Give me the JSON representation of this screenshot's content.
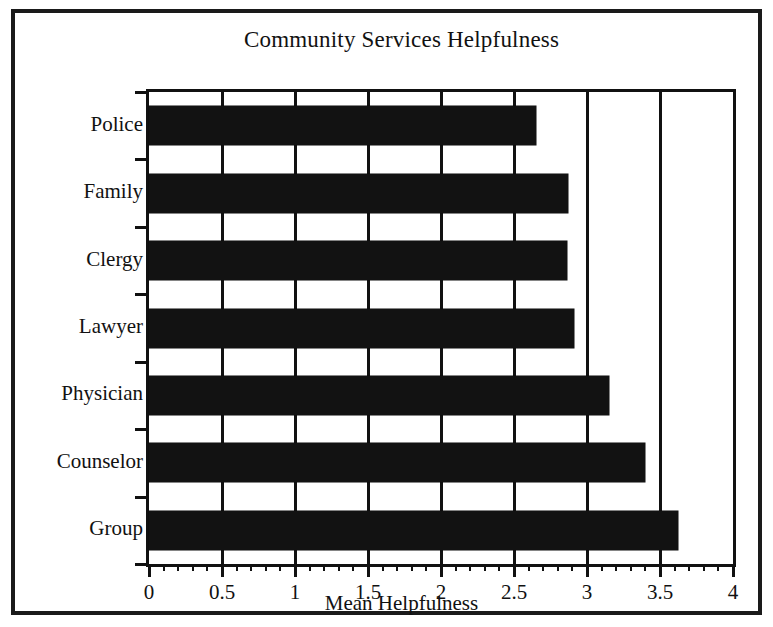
{
  "chart_data": {
    "type": "bar",
    "orientation": "horizontal",
    "title": "Community Services Helpfulness",
    "xlabel": "Mean Helpfulness",
    "ylabel": "",
    "categories": [
      "Police",
      "Family",
      "Clergy",
      "Lawyer",
      "Physician",
      "Counselor",
      "Group"
    ],
    "values": [
      2.65,
      2.87,
      2.86,
      2.91,
      3.15,
      3.4,
      3.62
    ],
    "xlim": [
      0,
      4
    ],
    "xticks": [
      0,
      0.5,
      1,
      1.5,
      2,
      2.5,
      3,
      3.5,
      4
    ],
    "xticklabels": [
      "0",
      "0.5",
      "1",
      "1.5",
      "2",
      "2.5",
      "3",
      "3.5",
      "4"
    ],
    "minor_tick_step": 0.1,
    "grid": "vertical",
    "gridlines": [
      0.5,
      1,
      1.5,
      2,
      2.5,
      3,
      3.5
    ],
    "legend": null,
    "bar_color": "#121212",
    "background_color": "#ffffff",
    "axis_color": "#111111"
  },
  "figure": {
    "frame_color": "#1a1a1a"
  }
}
